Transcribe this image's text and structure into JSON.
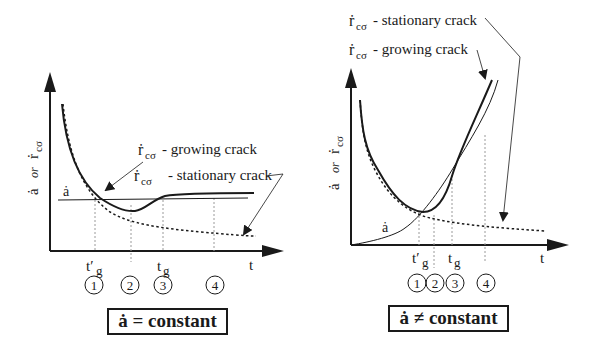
{
  "panels": [
    {
      "id": "left",
      "condition_label": "ȧ = constant",
      "y_axis_label": "ȧ or ṙcσ",
      "x_axis_label": "t",
      "t_prime_label": "t′g",
      "tg_label": "tg",
      "a_dot_label": "ȧ",
      "legend": [
        {
          "symbol": "ṙcσ",
          "text": "- growing crack",
          "line": "solid-thick"
        },
        {
          "symbol": "ṙcσ",
          "text": "- stationary crack",
          "line": "dotted"
        }
      ],
      "stages": [
        "1",
        "2",
        "3",
        "4"
      ]
    },
    {
      "id": "right",
      "condition_label": "ȧ ≠ constant",
      "y_axis_label": "ȧ or ṙcσ",
      "x_axis_label": "t",
      "t_prime_label": "t′g",
      "tg_label": "tg",
      "a_dot_label": "ȧ",
      "legend": [
        {
          "symbol": "ṙcσ",
          "text": "- stationary crack",
          "line": "dotted"
        },
        {
          "symbol": "ṙcσ",
          "text": "- growing crack",
          "line": "solid-thick"
        }
      ],
      "stages": [
        "1",
        "2",
        "3",
        "4"
      ]
    }
  ],
  "text": {
    "or": "or",
    "r_sym": "ṙ",
    "sub": "cσ",
    "a_sym": "ȧ",
    "t": "t",
    "tprime": "t′",
    "g": "g",
    "growing": "- growing crack",
    "stationary": "- stationary crack",
    "s1": "1",
    "s2": "2",
    "s3": "3",
    "s4": "4"
  },
  "colors": {
    "ink": "#1a1a1a",
    "guide": "#9a9a9a"
  }
}
